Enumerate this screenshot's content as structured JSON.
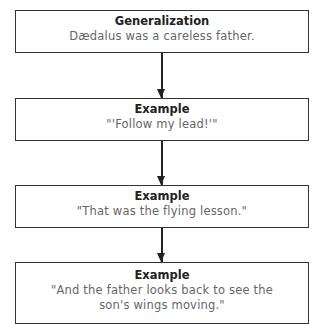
{
  "diagram": {
    "type": "flowchart",
    "nodes": [
      {
        "heading": "Generalization",
        "text": "Dædalus was a careless father."
      },
      {
        "heading": "Example",
        "text": "\"'Follow my lead!'\""
      },
      {
        "heading": "Example",
        "text": "\"That was the flying lesson.\""
      },
      {
        "heading": "Example",
        "text": "\"And the father looks back to see the son's wings moving.\""
      }
    ],
    "edges": [
      {
        "from": 0,
        "to": 1
      },
      {
        "from": 1,
        "to": 2
      },
      {
        "from": 2,
        "to": 3
      }
    ]
  }
}
